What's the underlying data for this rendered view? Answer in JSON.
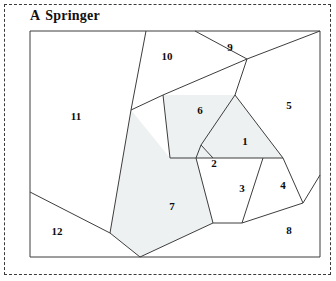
{
  "figure": {
    "panel_letter": "A",
    "title": "Springer",
    "frame_style": "dashed",
    "border_color": "#3a3a3a",
    "background_color": "#ffffff"
  },
  "diagram": {
    "type": "planar-subdivision",
    "plot_box": {
      "x": 30,
      "y": 31,
      "width": 290,
      "height": 226
    },
    "stroke_color": "#3d3d3d",
    "shaded_fill": "#eef1f2",
    "unshaded_fill": "#ffffff",
    "regions": [
      {
        "id": "1",
        "label": "1",
        "label_x": 245,
        "label_y": 142,
        "shaded": true,
        "points": "235,95 283,158 213,158 207,150 201,145"
      },
      {
        "id": "2",
        "label": "2",
        "label_x": 214,
        "label_y": 164,
        "shaded": true,
        "points": "201,145 213,158 196,158"
      },
      {
        "id": "3",
        "label": "3",
        "label_x": 242,
        "label_y": 189,
        "shaded": false,
        "points": "196,158 213,158 263,158 242,223 213,223"
      },
      {
        "id": "4",
        "label": "4",
        "label_x": 283,
        "label_y": 186,
        "shaded": false,
        "points": "263,158 283,158 303,203 242,223"
      },
      {
        "id": "5",
        "label": "5",
        "label_x": 289,
        "label_y": 106,
        "shaded": false,
        "points": "247,59 320,31 320,175 303,203 283,158 235,95"
      },
      {
        "id": "6",
        "label": "6",
        "label_x": 200,
        "label_y": 111,
        "shaded": true,
        "points": "163,95 235,95 201,145 196,158 170,158"
      },
      {
        "id": "7",
        "label": "7",
        "label_x": 172,
        "label_y": 207,
        "shaded": true,
        "points": "170,158 196,158 213,223 140,257 110,233 131,110"
      },
      {
        "id": "8",
        "label": "8",
        "label_x": 289,
        "label_y": 231,
        "shaded": false,
        "points": "303,203 320,175 320,257 140,257 213,223 242,223"
      },
      {
        "id": "9",
        "label": "9",
        "label_x": 230,
        "label_y": 48,
        "shaded": false,
        "points": "195,31 247,59 320,31"
      },
      {
        "id": "10",
        "label": "10",
        "label_x": 167,
        "label_y": 57,
        "shaded": false,
        "points": "146,31 195,31 247,59 163,95"
      },
      {
        "id": "11",
        "label": "11",
        "label_x": 76,
        "label_y": 117,
        "shaded": false,
        "points": "30,31 146,31 163,95 131,110 110,233 30,192"
      },
      {
        "id": "12",
        "label": "12",
        "label_x": 57,
        "label_y": 232,
        "shaded": false,
        "points": "30,192 110,233 140,257 30,257"
      }
    ],
    "edges": [
      {
        "name": "plot-border-top",
        "x1": 30,
        "y1": 31,
        "x2": 320,
        "y2": 31
      },
      {
        "name": "plot-border-right",
        "x1": 320,
        "y1": 31,
        "x2": 320,
        "y2": 257
      },
      {
        "name": "plot-border-bottom",
        "x1": 320,
        "y1": 257,
        "x2": 30,
        "y2": 257
      },
      {
        "name": "plot-border-left",
        "x1": 30,
        "y1": 257,
        "x2": 30,
        "y2": 31
      },
      {
        "name": "e-10-11",
        "x1": 146,
        "y1": 31,
        "x2": 131,
        "y2": 110
      },
      {
        "name": "e-11-7",
        "x1": 131,
        "y1": 110,
        "x2": 110,
        "y2": 233
      },
      {
        "name": "e-12-7",
        "x1": 110,
        "y1": 233,
        "x2": 140,
        "y2": 257
      },
      {
        "name": "e-11-12",
        "x1": 30,
        "y1": 192,
        "x2": 110,
        "y2": 233
      },
      {
        "name": "e-10-9",
        "x1": 195,
        "y1": 31,
        "x2": 247,
        "y2": 59
      },
      {
        "name": "e-9-5",
        "x1": 247,
        "y1": 59,
        "x2": 320,
        "y2": 31
      },
      {
        "name": "e-10-6",
        "x1": 247,
        "y1": 59,
        "x2": 163,
        "y2": 95
      },
      {
        "name": "e-11-6",
        "x1": 163,
        "y1": 95,
        "x2": 131,
        "y2": 110
      },
      {
        "name": "e-6-7",
        "x1": 163,
        "y1": 95,
        "x2": 170,
        "y2": 158
      },
      {
        "name": "e-7-3",
        "x1": 170,
        "y1": 158,
        "x2": 196,
        "y2": 158
      },
      {
        "name": "e-6-1",
        "x1": 235,
        "y1": 95,
        "x2": 201,
        "y2": 145
      },
      {
        "name": "e-5-1",
        "x1": 247,
        "y1": 59,
        "x2": 235,
        "y2": 95
      },
      {
        "name": "e-1-5b",
        "x1": 235,
        "y1": 95,
        "x2": 283,
        "y2": 158
      },
      {
        "name": "e-2-1",
        "x1": 201,
        "y1": 145,
        "x2": 213,
        "y2": 158
      },
      {
        "name": "e-2-3",
        "x1": 196,
        "y1": 158,
        "x2": 201,
        "y2": 145
      },
      {
        "name": "e-1-3",
        "x1": 196,
        "y1": 158,
        "x2": 283,
        "y2": 158
      },
      {
        "name": "e-3-7",
        "x1": 196,
        "y1": 158,
        "x2": 213,
        "y2": 223
      },
      {
        "name": "e-3-8",
        "x1": 213,
        "y1": 223,
        "x2": 140,
        "y2": 257
      },
      {
        "name": "e-3-4",
        "x1": 263,
        "y1": 158,
        "x2": 242,
        "y2": 223
      },
      {
        "name": "e-3-4b",
        "x1": 213,
        "y1": 223,
        "x2": 242,
        "y2": 223
      },
      {
        "name": "e-4-5",
        "x1": 283,
        "y1": 158,
        "x2": 303,
        "y2": 203
      },
      {
        "name": "e-4-8",
        "x1": 242,
        "y1": 223,
        "x2": 303,
        "y2": 203
      },
      {
        "name": "e-8-5",
        "x1": 303,
        "y1": 203,
        "x2": 320,
        "y2": 175
      }
    ]
  }
}
